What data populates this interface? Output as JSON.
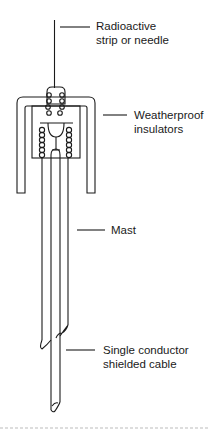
{
  "diagram": {
    "colors": {
      "stroke": "#1a1a1a",
      "background": "#ffffff",
      "divider": "#bbbbbb"
    },
    "labels": [
      {
        "id": "radioactive",
        "line1": "Radioactive",
        "line2": "strip or needle"
      },
      {
        "id": "insulators",
        "line1": "Weatherproof",
        "line2": "insulators"
      },
      {
        "id": "mast",
        "line1": "Mast"
      },
      {
        "id": "cable",
        "line1": "Single conductor",
        "line2": "shielded cable"
      }
    ]
  }
}
